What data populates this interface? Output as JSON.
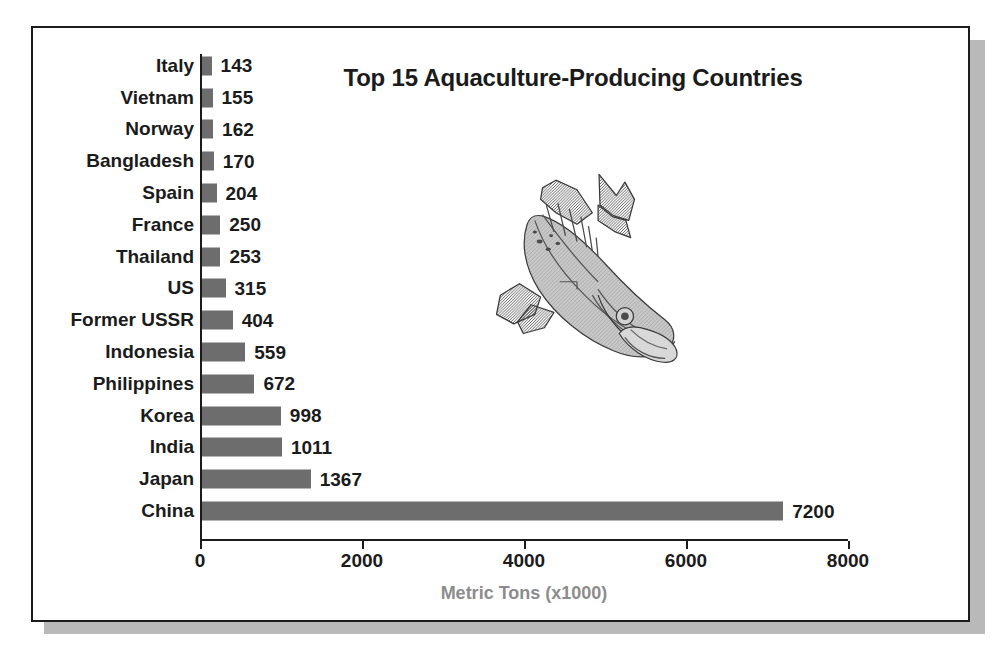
{
  "chart_data": {
    "type": "bar",
    "orientation": "horizontal",
    "title": "Top 15 Aquaculture-Producing Countries",
    "xlabel": "Metric Tons (x1000)",
    "ylabel": "",
    "categories": [
      "Italy",
      "Vietnam",
      "Norway",
      "Bangladesh",
      "Spain",
      "France",
      "Thailand",
      "US",
      "Former USSR",
      "Indonesia",
      "Philippines",
      "Korea",
      "India",
      "Japan",
      "China"
    ],
    "values": [
      143,
      155,
      162,
      170,
      204,
      250,
      253,
      315,
      404,
      559,
      672,
      998,
      1011,
      1367,
      7200
    ],
    "value_labels": [
      "143",
      "155",
      "162",
      "170",
      "204",
      "250",
      "253",
      "315",
      "404",
      "559",
      "672",
      "998",
      "1011",
      "1367",
      "7200"
    ],
    "xlim": [
      0,
      8000
    ],
    "xticks": [
      0,
      2000,
      4000,
      6000,
      8000
    ],
    "xtick_labels": [
      "0",
      "2000",
      "4000",
      "6000",
      "8000"
    ],
    "grid": false,
    "legend": false,
    "bar_color": "#6d6d6d",
    "axis_color": "#1b1b1b",
    "xlabel_color": "#8c8c8c",
    "background_color": "#ffffff",
    "frame_border_color": "#1b1b1b",
    "shadow_color": "#b9b9b9"
  },
  "illustration": {
    "name": "salmon-fish-illustration",
    "description": "Salmon fish drawing"
  }
}
